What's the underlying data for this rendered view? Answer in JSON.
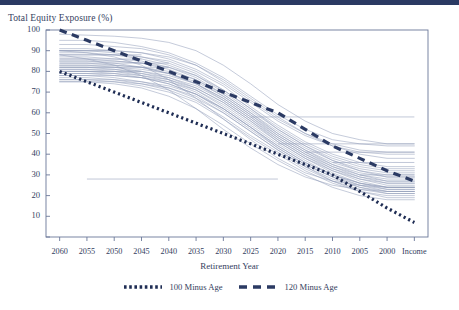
{
  "header": {
    "bar_color": "#2b3a63"
  },
  "chart_data": {
    "type": "line",
    "title": "",
    "ylabel": "Total Equity Exposure (%)",
    "xlabel": "Retirement Year",
    "grid": false,
    "legend_position": "bottom",
    "ylim": [
      0,
      100
    ],
    "ytick_labels": [
      "100",
      "90",
      "80",
      "70",
      "60",
      "50",
      "40",
      "30",
      "20",
      "10"
    ],
    "ytick_values": [
      100,
      90,
      80,
      70,
      60,
      50,
      40,
      30,
      20,
      10
    ],
    "categories": [
      "2060",
      "2055",
      "2050",
      "2045",
      "2040",
      "2035",
      "2030",
      "2025",
      "2020",
      "2015",
      "2010",
      "2005",
      "2000",
      "Income"
    ],
    "series": [
      {
        "name": "100 Minus Age",
        "style": "dotted",
        "color": "#1f2d54",
        "width": 3.2,
        "values": [
          80,
          75,
          70,
          65,
          60,
          55,
          50,
          45,
          40,
          35,
          30,
          22,
          14,
          7
        ]
      },
      {
        "name": "120 Minus Age",
        "style": "dashed",
        "color": "#2b3a63",
        "width": 3.2,
        "values": [
          100,
          95,
          90,
          85,
          80,
          75,
          70,
          65,
          60,
          52,
          44,
          38,
          32,
          27
        ]
      }
    ],
    "glide_paths": {
      "name": "Target Date Fund Glide Paths",
      "style": "solid-thin",
      "color": "#8f9bb8",
      "width": 0.55,
      "count": 32,
      "series": [
        {
          "values": [
            98,
            97.5,
            97,
            96,
            94,
            90,
            83,
            74,
            64,
            56,
            50,
            47,
            45,
            45
          ]
        },
        {
          "values": [
            95,
            95,
            94,
            92,
            89,
            84,
            77,
            68,
            59,
            52,
            47,
            45,
            44,
            44
          ]
        },
        {
          "values": [
            93,
            93,
            92,
            91,
            88,
            83,
            75,
            66,
            57,
            50,
            45,
            42,
            41,
            41
          ]
        },
        {
          "values": [
            91,
            91,
            90,
            89,
            86,
            81,
            74,
            65,
            56,
            49,
            44,
            41,
            40,
            40
          ]
        },
        {
          "values": [
            90,
            90,
            90,
            89,
            87,
            83,
            76,
            67,
            58,
            50,
            44,
            40,
            38,
            38
          ]
        },
        {
          "values": [
            90,
            90,
            89,
            87,
            84,
            79,
            71,
            62,
            53,
            45,
            39,
            35,
            33,
            33
          ]
        },
        {
          "values": [
            89,
            89,
            88,
            86,
            83,
            78,
            70,
            61,
            52,
            44,
            38,
            34,
            32,
            32
          ]
        },
        {
          "values": [
            88,
            88,
            88,
            87,
            85,
            80,
            73,
            63,
            54,
            46,
            40,
            36,
            34,
            34
          ]
        },
        {
          "values": [
            87,
            87,
            86,
            85,
            82,
            77,
            69,
            60,
            51,
            43,
            37,
            33,
            31,
            31
          ]
        },
        {
          "values": [
            86,
            86,
            85,
            84,
            81,
            76,
            68,
            59,
            50,
            42,
            36,
            32,
            30,
            30
          ]
        },
        {
          "values": [
            85,
            85,
            85,
            84,
            82,
            78,
            71,
            62,
            52,
            44,
            37,
            32,
            29,
            29
          ]
        },
        {
          "values": [
            85,
            85,
            84,
            82,
            79,
            74,
            66,
            57,
            48,
            40,
            34,
            30,
            28,
            28
          ]
        },
        {
          "values": [
            84,
            84,
            83,
            82,
            79,
            74,
            67,
            58,
            49,
            41,
            35,
            31,
            29,
            29
          ]
        },
        {
          "values": [
            83,
            83,
            83,
            82,
            80,
            76,
            69,
            60,
            50,
            42,
            35,
            30,
            27,
            27
          ]
        },
        {
          "values": [
            83,
            83,
            82,
            80,
            77,
            72,
            65,
            56,
            47,
            39,
            33,
            29,
            27,
            27
          ]
        },
        {
          "values": [
            82,
            82,
            82,
            81,
            79,
            75,
            68,
            59,
            49,
            41,
            34,
            29,
            26,
            26
          ]
        },
        {
          "values": [
            82,
            82,
            81,
            79,
            76,
            71,
            64,
            55,
            46,
            38,
            32,
            28,
            26,
            26
          ]
        },
        {
          "values": [
            81,
            81,
            81,
            80,
            78,
            74,
            67,
            58,
            48,
            40,
            33,
            28,
            25,
            25
          ]
        },
        {
          "values": [
            81,
            81,
            80,
            78,
            75,
            70,
            62,
            53,
            44,
            36,
            30,
            26,
            24,
            24
          ]
        },
        {
          "values": [
            80,
            80,
            80,
            79,
            77,
            73,
            66,
            57,
            47,
            39,
            32,
            27,
            24,
            24
          ]
        },
        {
          "values": [
            80,
            80,
            79,
            77,
            74,
            69,
            61,
            52,
            43,
            35,
            29,
            25,
            23,
            23
          ]
        },
        {
          "values": [
            79,
            79,
            78,
            77,
            74,
            69,
            62,
            53,
            44,
            36,
            30,
            26,
            24,
            24
          ]
        },
        {
          "values": [
            79,
            79,
            79,
            78,
            76,
            72,
            65,
            56,
            46,
            38,
            31,
            26,
            23,
            23
          ]
        },
        {
          "values": [
            78,
            78,
            77,
            75,
            72,
            67,
            60,
            51,
            42,
            34,
            28,
            24,
            22,
            22
          ]
        },
        {
          "values": [
            78,
            78,
            78,
            77,
            75,
            71,
            63,
            54,
            45,
            37,
            30,
            25,
            22,
            22
          ]
        },
        {
          "values": [
            77,
            77,
            76,
            74,
            71,
            66,
            58,
            49,
            41,
            33,
            27,
            23,
            21,
            21
          ]
        },
        {
          "values": [
            76,
            76,
            76,
            75,
            73,
            69,
            62,
            53,
            43,
            35,
            29,
            24,
            21,
            21
          ]
        },
        {
          "values": [
            76,
            76,
            75,
            73,
            70,
            65,
            57,
            48,
            40,
            32,
            26,
            22,
            20,
            20
          ]
        },
        {
          "values": [
            75,
            75,
            75,
            74,
            72,
            68,
            60,
            51,
            42,
            34,
            27,
            22,
            19,
            19
          ]
        },
        {
          "values": [
            75,
            75,
            74,
            72,
            68,
            62,
            54,
            45,
            37,
            30,
            24,
            20,
            18,
            18
          ]
        },
        {
          "values": [
            90,
            89,
            87,
            83,
            76,
            67,
            57,
            47,
            38,
            31,
            27,
            25,
            24,
            24
          ]
        },
        {
          "values": [
            88,
            86,
            83,
            78,
            71,
            62,
            52,
            43,
            35,
            29,
            25,
            23,
            22,
            22
          ]
        }
      ],
      "flat_segments": [
        {
          "y": 58,
          "x_start": 7,
          "x_end": 13
        },
        {
          "y": 45,
          "x_start": 8,
          "x_end": 13
        },
        {
          "y": 41,
          "x_start": 9,
          "x_end": 13
        },
        {
          "y": 28,
          "x_start": 1,
          "x_end": 8
        },
        {
          "y": 30,
          "x_start": 11,
          "x_end": 13
        },
        {
          "y": 36,
          "x_start": 10,
          "x_end": 13
        },
        {
          "y": 86,
          "x_start": 0,
          "x_end": 3
        },
        {
          "y": 84,
          "x_start": 0,
          "x_end": 4
        },
        {
          "y": 88,
          "x_start": 0,
          "x_end": 3
        },
        {
          "y": 90,
          "x_start": 0,
          "x_end": 2
        },
        {
          "y": 82,
          "x_start": 0,
          "x_end": 4
        },
        {
          "y": 80,
          "x_start": 0,
          "x_end": 3
        }
      ]
    }
  },
  "axes": {
    "plot_left": 46,
    "plot_right": 428,
    "plot_top": 30,
    "plot_bottom": 237,
    "border_color": "#6b7899"
  }
}
